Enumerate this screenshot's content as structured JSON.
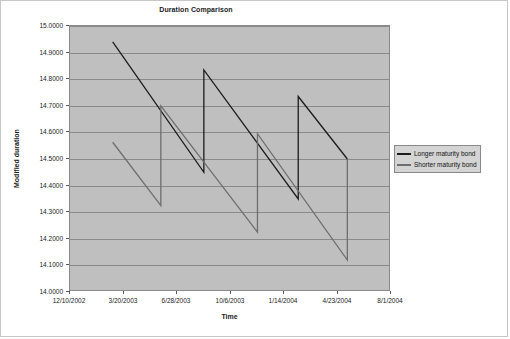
{
  "chart_data": {
    "type": "line",
    "title": "Duration Comparison",
    "xlabel": "Time",
    "ylabel": "Modified duration",
    "ylim": [
      14.0,
      15.0
    ],
    "ytick_labels": [
      "15.0000",
      "14.9000",
      "14.8000",
      "14.7000",
      "14.6000",
      "14.5000",
      "14.4000",
      "14.3000",
      "14.2000",
      "14.1000",
      "14.0000"
    ],
    "ytick_values": [
      15.0,
      14.9,
      14.8,
      14.7,
      14.6,
      14.5,
      14.4,
      14.3,
      14.2,
      14.1,
      14.0
    ],
    "xtick_labels": [
      "12/10/2002",
      "3/20/2003",
      "6/28/2003",
      "10/6/2003",
      "1/14/2004",
      "4/23/2004",
      "8/1/2004"
    ],
    "xlim_labels": [
      "12/10/2002",
      "8/1/2004"
    ],
    "grid": "horizontal",
    "legend_position": "right",
    "plot_background": "#bfbfbf",
    "series": [
      {
        "name": "Longer maturity bond",
        "color": "#1c1c1c",
        "points": [
          {
            "x": 0.133,
            "y": 14.94
          },
          {
            "x": 0.417,
            "y": 14.45
          },
          {
            "x": 0.417,
            "y": 14.835
          },
          {
            "x": 0.711,
            "y": 14.35
          },
          {
            "x": 0.711,
            "y": 14.735
          },
          {
            "x": 0.864,
            "y": 14.5
          }
        ]
      },
      {
        "name": "Shorter maturity bond",
        "color": "#6e6e6e",
        "points": [
          {
            "x": 0.133,
            "y": 14.563
          },
          {
            "x": 0.283,
            "y": 14.325
          },
          {
            "x": 0.283,
            "y": 14.7
          },
          {
            "x": 0.584,
            "y": 14.225
          },
          {
            "x": 0.584,
            "y": 14.595
          },
          {
            "x": 0.864,
            "y": 14.12
          },
          {
            "x": 0.864,
            "y": 14.5
          }
        ]
      }
    ]
  },
  "legend": {
    "items": [
      {
        "label": "Longer maturity bond"
      },
      {
        "label": "Shorter maturity bond"
      }
    ]
  }
}
